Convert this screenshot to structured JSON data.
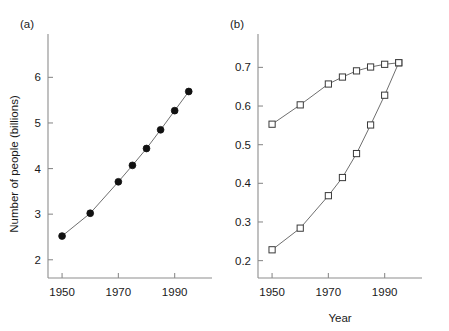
{
  "figure": {
    "background_color": "#ffffff",
    "axis_color": "#8d8d8d",
    "line_color": "#6f6f6f",
    "marker_fill_color": "#111111",
    "marker_open_color": "#ffffff",
    "shared_xlabel": "Year"
  },
  "panels": [
    {
      "id": "a",
      "label": "(a)",
      "ylabel": "Number of people (billions)",
      "xlabel": "",
      "x_ticks": [
        1950,
        1970,
        1990
      ],
      "x_tick_labels": [
        "1950",
        "1970",
        "1990"
      ],
      "y_ticks": [
        2,
        3,
        4,
        5,
        6
      ],
      "y_tick_labels": [
        "2",
        "3",
        "4",
        "5",
        "6"
      ],
      "xlim": [
        1945,
        1999
      ],
      "ylim": [
        1.6,
        6.6
      ],
      "grid": false,
      "legend": "none"
    },
    {
      "id": "b",
      "label": "(b)",
      "ylabel": "",
      "xlabel": "",
      "x_ticks": [
        1950,
        1970,
        1990
      ],
      "x_tick_labels": [
        "1950",
        "1970",
        "1990"
      ],
      "y_ticks": [
        0.2,
        0.3,
        0.4,
        0.5,
        0.6,
        0.7
      ],
      "y_tick_labels": [
        "0.2",
        "0.3",
        "0.4",
        "0.5",
        "0.6",
        "0.7"
      ],
      "xlim": [
        1945,
        1999
      ],
      "ylim": [
        0.155,
        0.745
      ],
      "grid": false,
      "legend": "none"
    }
  ],
  "chart_data": [
    {
      "type": "line",
      "panel": "a",
      "title": "(a)",
      "xlabel": "Year",
      "ylabel": "Number of people (billions)",
      "xlim": [
        1945,
        1999
      ],
      "ylim": [
        1.6,
        6.6
      ],
      "xticks": [
        1950,
        1970,
        1990
      ],
      "yticks": [
        2,
        3,
        4,
        5,
        6
      ],
      "grid": false,
      "legend": "none",
      "marker": "filled-circle",
      "series": [
        {
          "name": "World population",
          "marker": "filled-circle",
          "x": [
            1950,
            1960,
            1970,
            1975,
            1980,
            1985,
            1990,
            1995
          ],
          "y": [
            2.52,
            3.02,
            3.71,
            4.07,
            4.44,
            4.85,
            5.27,
            5.69
          ]
        }
      ]
    },
    {
      "type": "line",
      "panel": "b",
      "title": "(b)",
      "xlabel": "Year",
      "ylabel": "",
      "xlim": [
        1945,
        1999
      ],
      "ylim": [
        0.155,
        0.745
      ],
      "xticks": [
        1950,
        1970,
        1990
      ],
      "yticks": [
        0.2,
        0.3,
        0.4,
        0.5,
        0.6,
        0.7
      ],
      "grid": false,
      "legend": "none",
      "marker": "open-square",
      "series": [
        {
          "name": "Upper curve",
          "marker": "open-square",
          "x": [
            1950,
            1960,
            1970,
            1975,
            1980,
            1985,
            1990,
            1995
          ],
          "y": [
            0.553,
            0.603,
            0.657,
            0.675,
            0.691,
            0.701,
            0.708,
            0.712
          ]
        },
        {
          "name": "Lower curve",
          "marker": "open-square",
          "x": [
            1950,
            1960,
            1970,
            1975,
            1980,
            1985,
            1990,
            1995
          ],
          "y": [
            0.228,
            0.284,
            0.368,
            0.415,
            0.477,
            0.551,
            0.628,
            0.712
          ]
        }
      ]
    }
  ]
}
